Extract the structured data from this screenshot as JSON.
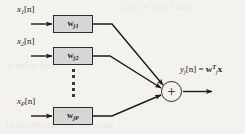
{
  "figure": {
    "background_color": "#f4f2ee",
    "ink_color": "#1a1a1a",
    "block_fill_color": "#d6d6d6",
    "block_border_color": "#2b2b2b"
  },
  "inputs": [
    {
      "id": "input-1",
      "base": "x",
      "subscript": "1",
      "index": "[n]"
    },
    {
      "id": "input-2",
      "base": "x",
      "subscript": "2",
      "index": "[n]"
    },
    {
      "id": "input-3",
      "base": "x",
      "subscript": "P",
      "index": "[n]"
    }
  ],
  "weight_blocks": [
    {
      "id": "block-1",
      "base": "w",
      "subscript": "j1"
    },
    {
      "id": "block-2",
      "base": "w",
      "subscript": "j2"
    },
    {
      "id": "block-3",
      "base": "w",
      "subscript": "jP"
    }
  ],
  "ellipsis": {
    "label": "vertical-ellipsis",
    "dot_count": 5
  },
  "summation": {
    "glyph": "+",
    "label": "summing junction"
  },
  "output": {
    "base": "y",
    "subscript": "j",
    "index": "[n]",
    "equals": "=",
    "weight_vector": "w",
    "weight_subscript": "j",
    "transpose": "T",
    "input_vector": "x"
  },
  "bleed_text": {
    "top": "a(n) = s(n) Thus",
    "middle": "a delay line",
    "bottom": "In the Me the tha the  cond"
  }
}
